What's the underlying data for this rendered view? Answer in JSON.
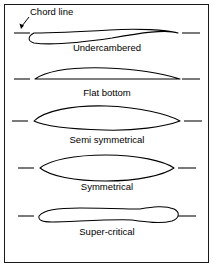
{
  "figure": {
    "background_color": "#ffffff",
    "line_color": "#000000",
    "border_color": "#1a1a1a",
    "width": 214,
    "height": 268
  },
  "annotation": {
    "chord_line_label": "Chord line",
    "label_x": 30,
    "label_y": 15,
    "leader_from_x": 29,
    "leader_from_y": 17,
    "leader_to_x": 21,
    "leader_to_y": 27,
    "arrow_name": "chord-line-pointer"
  },
  "airfoils": [
    {
      "id": "undercambered",
      "label": "Undercambered",
      "caption_x": 107,
      "caption_y": 51,
      "chord_y": 33,
      "dash_left": {
        "x1": 14,
        "x2": 30
      },
      "dash_right": {
        "x1": 182,
        "x2": 200
      },
      "path": "M 34 33 C 28 36 27 41 34 43 C 48 45 78 43 112 38 C 140 33 166 29 178 33 C 166 30 138 28 110 30 C 76 32 48 33 34 33 Z",
      "description": "Thin strongly cambered section with concave lower surface"
    },
    {
      "id": "flat-bottom",
      "label": "Flat bottom",
      "caption_x": 107,
      "caption_y": 96,
      "chord_y": 79,
      "dash_left": {
        "x1": 14,
        "x2": 30
      },
      "dash_right": {
        "x1": 182,
        "x2": 200
      },
      "path": "M 35 79 C 47 71 72 67 106 68 C 136 69 164 74 180 79 L 35 79 Z",
      "description": "Curved upper surface with straight flat lower surface"
    },
    {
      "id": "semi-symmetrical",
      "label": "Semi symmetrical",
      "caption_x": 107,
      "caption_y": 143,
      "chord_y": 121,
      "dash_left": {
        "x1": 12,
        "x2": 28
      },
      "dash_right": {
        "x1": 184,
        "x2": 202
      },
      "path": "M 34 121 C 44 111 72 105 106 106 C 138 107 168 114 180 121 C 164 127 134 131 104 130 C 70 129 44 126 34 121 Z",
      "description": "Lens shape with more curvature above the chord than below"
    },
    {
      "id": "symmetrical",
      "label": "Symmetrical",
      "caption_x": 107,
      "caption_y": 190,
      "chord_y": 168,
      "dash_left": {
        "x1": 18,
        "x2": 34
      },
      "dash_right": {
        "x1": 178,
        "x2": 196
      },
      "path": "M 40 168 C 50 160 74 155 106 155 C 138 155 164 161 174 168 C 164 175 138 181 106 181 C 74 181 50 176 40 168 Z",
      "description": "Equal curvature above and below the chord line"
    },
    {
      "id": "super-critical",
      "label": "Super-critical",
      "caption_x": 107,
      "caption_y": 235,
      "chord_y": 216,
      "dash_left": {
        "x1": 18,
        "x2": 34
      },
      "dash_right": {
        "x1": 178,
        "x2": 196
      },
      "path": "M 39 216 C 44 210 56 208 80 208 C 110 208 128 209 140 209 C 152 207 164 205 174 209 C 180 212 180 218 172 221 C 160 224 146 222 132 220 C 108 219 70 222 52 222 C 42 222 38 220 39 216 Z",
      "description": "Flattened upper surface with reflexed downward trailing edge"
    }
  ]
}
